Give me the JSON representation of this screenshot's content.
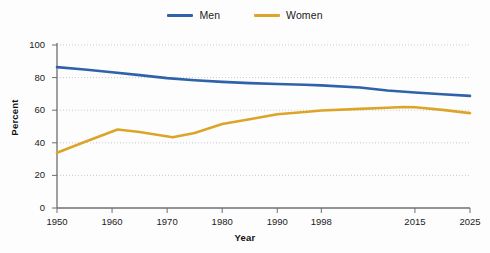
{
  "chart_data": {
    "type": "line",
    "title": "",
    "xlabel": "Year",
    "ylabel": "Percent",
    "xlim": [
      1950,
      2025
    ],
    "ylim": [
      0,
      100
    ],
    "grid": true,
    "legend_position": "top-center",
    "x_tick_labels": [
      "1950",
      "1960",
      "1970",
      "1980",
      "1990",
      "1998",
      "2015",
      "2025"
    ],
    "x_ticks": [
      1950,
      1960,
      1970,
      1980,
      1990,
      1998,
      2015,
      2025
    ],
    "y_tick_labels": [
      "0",
      "20",
      "40",
      "60",
      "80",
      "100"
    ],
    "y_ticks": [
      0,
      20,
      40,
      60,
      80,
      100
    ],
    "series": [
      {
        "name": "Men",
        "color": "#2f62ab",
        "x": [
          1950,
          1955,
          1960,
          1965,
          1970,
          1975,
          1980,
          1985,
          1990,
          1995,
          1998,
          2005,
          2010,
          2015,
          2020,
          2025
        ],
        "values": [
          86.4,
          85.0,
          83.3,
          81.5,
          79.7,
          78.4,
          77.4,
          76.6,
          76.1,
          75.6,
          75.2,
          73.9,
          72.1,
          70.9,
          69.8,
          68.8
        ]
      },
      {
        "name": "Women",
        "color": "#dca52a",
        "x": [
          1950,
          1955,
          1961,
          1965,
          1971,
          1975,
          1980,
          1985,
          1990,
          1995,
          1998,
          2005,
          2010,
          2013,
          2015,
          2020,
          2025
        ],
        "values": [
          33.9,
          40.5,
          48.2,
          46.6,
          43.4,
          46.0,
          51.5,
          54.5,
          57.5,
          58.9,
          59.8,
          60.8,
          61.5,
          62.0,
          61.8,
          60.2,
          58.2
        ]
      }
    ]
  },
  "legend": {
    "items": [
      {
        "label": "Men",
        "color": "#2f62ab"
      },
      {
        "label": "Women",
        "color": "#dca52a"
      }
    ]
  },
  "axes": {
    "y_title": "Percent",
    "x_title": "Year"
  }
}
